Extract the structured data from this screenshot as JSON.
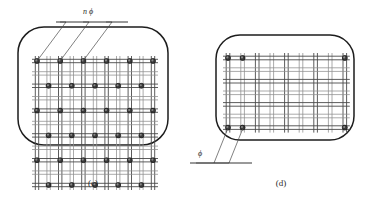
{
  "figure": {
    "background_color": "#ffffff",
    "outline_color": "#1d1d1d",
    "grid_color": "#8d8d8d",
    "grid_dark_color": "#4a4a4a",
    "dot_fill_color": "#3a3a3a",
    "dot_highlight_color": "#8a8a8a",
    "panels": [
      {
        "id": "c",
        "caption": "(c)",
        "caption_x": 93,
        "caption_y": 186,
        "label": "n ϕ",
        "label_x": 88,
        "label_y": 14,
        "section": {
          "x": 18,
          "y": 27,
          "width": 150,
          "height": 118,
          "corner_radius": 26
        },
        "grid": {
          "x0": 37,
          "y0": 61,
          "col_step": 11.6,
          "row_step": 12.4,
          "cols": 11,
          "rows": 11,
          "pair_gap": 3.4
        },
        "dots": [
          {
            "col": 0,
            "row": 0
          },
          {
            "col": 2,
            "row": 0
          },
          {
            "col": 4,
            "row": 0
          },
          {
            "col": 6,
            "row": 0
          },
          {
            "col": 8,
            "row": 0
          },
          {
            "col": 10,
            "row": 0
          },
          {
            "col": 1,
            "row": 2
          },
          {
            "col": 3,
            "row": 2
          },
          {
            "col": 5,
            "row": 2
          },
          {
            "col": 7,
            "row": 2
          },
          {
            "col": 9,
            "row": 2
          },
          {
            "col": 0,
            "row": 4
          },
          {
            "col": 2,
            "row": 4
          },
          {
            "col": 4,
            "row": 4
          },
          {
            "col": 6,
            "row": 4
          },
          {
            "col": 8,
            "row": 4
          },
          {
            "col": 10,
            "row": 4
          },
          {
            "col": 1,
            "row": 6
          },
          {
            "col": 3,
            "row": 6
          },
          {
            "col": 5,
            "row": 6
          },
          {
            "col": 7,
            "row": 6
          },
          {
            "col": 9,
            "row": 6
          },
          {
            "col": 0,
            "row": 8
          },
          {
            "col": 2,
            "row": 8
          },
          {
            "col": 4,
            "row": 8
          },
          {
            "col": 6,
            "row": 8
          },
          {
            "col": 8,
            "row": 8
          },
          {
            "col": 10,
            "row": 8
          },
          {
            "col": 1,
            "row": 10
          },
          {
            "col": 3,
            "row": 10
          },
          {
            "col": 5,
            "row": 10
          },
          {
            "col": 7,
            "row": 10
          },
          {
            "col": 9,
            "row": 10
          }
        ],
        "dot_radius": 2.5,
        "leaders": [
          {
            "from_x": 37,
            "from_y": 61,
            "bend_x": 66,
            "bend_y": 22,
            "end_x": 60,
            "end_y": 22
          },
          {
            "from_x": 60,
            "from_y": 61,
            "bend_x": 89,
            "bend_y": 22,
            "end_x": 83,
            "end_y": 22
          },
          {
            "from_x": 83,
            "from_y": 61,
            "bend_x": 112,
            "bend_y": 22,
            "end_x": 106,
            "end_y": 22
          }
        ],
        "leader_rule": {
          "x1": 56,
          "y1": 22,
          "x2": 128,
          "y2": 22
        }
      },
      {
        "id": "d",
        "caption": "(d)",
        "caption_x": 281,
        "caption_y": 186,
        "label": "ϕ",
        "label_x": 200,
        "label_y": 156,
        "section": {
          "x": 216,
          "y": 35,
          "width": 138,
          "height": 105,
          "corner_radius": 24
        },
        "grid": {
          "x0": 228,
          "y0": 58,
          "col_step": 14.6,
          "row_step": 11.6,
          "cols": 9,
          "rows": 7,
          "pair_gap": 3.6
        },
        "dots": [
          {
            "col": 0,
            "row": 0
          },
          {
            "col": 1,
            "row": 0
          },
          {
            "col": 8,
            "row": 0
          },
          {
            "col": 0,
            "row": 6
          },
          {
            "col": 1,
            "row": 6
          },
          {
            "col": 8,
            "row": 6
          }
        ],
        "dot_radius": 2.5,
        "leaders": [
          {
            "from_x": 228,
            "from_y": 128,
            "bend_x": 214,
            "bend_y": 163,
            "end_x": 196,
            "end_y": 163
          },
          {
            "from_x": 243,
            "from_y": 128,
            "bend_x": 229,
            "bend_y": 163,
            "end_x": 214,
            "end_y": 163
          }
        ],
        "leader_rule": {
          "x1": 190,
          "y1": 163,
          "x2": 252,
          "y2": 163
        }
      }
    ]
  }
}
